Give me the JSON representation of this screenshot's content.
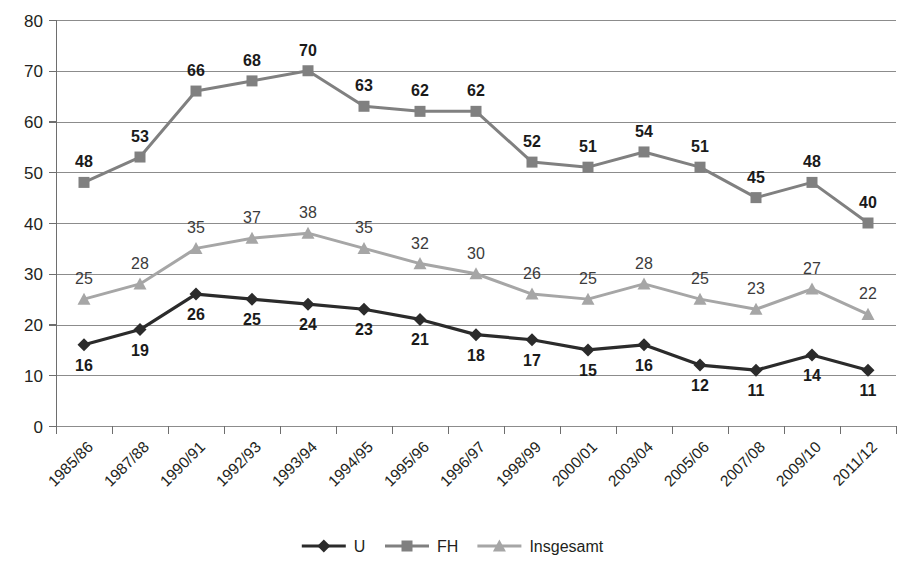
{
  "chart_data": {
    "type": "line",
    "title": "",
    "subtitle": "",
    "xlabel": "",
    "ylabel": "",
    "ylim": [
      0,
      80
    ],
    "ytick_step": 10,
    "yticks": [
      0,
      10,
      20,
      30,
      40,
      50,
      60,
      70,
      80
    ],
    "grid": true,
    "legend_position": "bottom",
    "categories": [
      "1985/86",
      "1987/88",
      "1990/91",
      "1992/93",
      "1993/94",
      "1994/95",
      "1995/96",
      "1996/97",
      "1998/99",
      "2000/01",
      "2003/04",
      "2005/06",
      "2007/08",
      "2009/10",
      "2011/12"
    ],
    "series": [
      {
        "name": "U",
        "marker": "diamond",
        "color": "#2b2b2b",
        "label_position": "below",
        "values": [
          16,
          19,
          26,
          25,
          24,
          23,
          21,
          18,
          17,
          15,
          16,
          12,
          11,
          14,
          11
        ]
      },
      {
        "name": "FH",
        "marker": "square",
        "color": "#808080",
        "label_position": "above",
        "values": [
          48,
          53,
          66,
          68,
          70,
          63,
          62,
          62,
          52,
          51,
          54,
          51,
          45,
          48,
          40
        ]
      },
      {
        "name": "Insgesamt",
        "marker": "triangle",
        "color": "#a6a6a6",
        "label_position": "above",
        "values": [
          25,
          28,
          35,
          37,
          38,
          35,
          32,
          30,
          26,
          25,
          28,
          25,
          23,
          27,
          22
        ]
      }
    ]
  },
  "legend": {
    "items": [
      {
        "label": "U",
        "color": "#2b2b2b",
        "marker": "diamond"
      },
      {
        "label": "FH",
        "color": "#808080",
        "marker": "square"
      },
      {
        "label": "Insgesamt",
        "color": "#a6a6a6",
        "marker": "triangle"
      }
    ]
  },
  "colors": {
    "u": "#2b2b2b",
    "fh": "#808080",
    "insgesamt": "#a6a6a6",
    "grid": "#8c8c8c",
    "axis": "#6e6e6e",
    "text": "#231f20",
    "background": "#ffffff"
  }
}
